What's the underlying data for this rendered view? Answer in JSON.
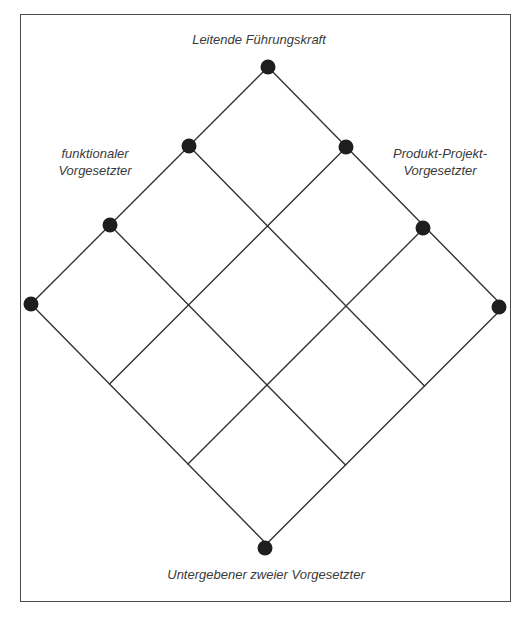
{
  "diagram": {
    "type": "matrix-organization-lattice",
    "labels": {
      "top": "Leitende Führungskraft",
      "left": [
        "funktionaler",
        "Vorgesetzter"
      ],
      "right": [
        "Produkt-Projekt-",
        "Vorgesetzter"
      ],
      "bottom": "Untergebener zweier Vorgesetzter"
    },
    "lattice": {
      "origin": [
        268,
        67
      ],
      "left_step": [
        -79,
        79
      ],
      "right_step": [
        78.5,
        80
      ],
      "size": 3
    },
    "nodes": [
      {
        "name": "top-node",
        "pos": [
          268,
          67
        ]
      },
      {
        "name": "functional-node-1",
        "pos": [
          189,
          146
        ]
      },
      {
        "name": "functional-node-2",
        "pos": [
          110,
          225
        ]
      },
      {
        "name": "functional-node-3",
        "pos": [
          31,
          304
        ]
      },
      {
        "name": "product-node-1",
        "pos": [
          346,
          147
        ]
      },
      {
        "name": "product-node-2",
        "pos": [
          423,
          228
        ]
      },
      {
        "name": "product-node-3",
        "pos": [
          499,
          307
        ]
      },
      {
        "name": "bottom-node",
        "pos": [
          265,
          548
        ]
      }
    ],
    "colors": {
      "line": "#333333",
      "node": "#1e1e1e",
      "frame": "#4a4a4a",
      "text": "#3a3a3a",
      "background": "#ffffff"
    }
  }
}
